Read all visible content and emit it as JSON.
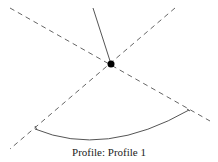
{
  "diagram": {
    "caption": "Profile:  Profile 1",
    "colors": {
      "line": "#555555",
      "dashed": "#666666",
      "point": "#000000",
      "background": "#ffffff"
    },
    "elements": {
      "solid_line": {
        "x1": 93,
        "y1": 8,
        "x2": 111,
        "y2": 64
      },
      "dashed_line_a": {
        "x1": 10,
        "y1": 8,
        "x2": 210,
        "y2": 121
      },
      "dashed_line_b": {
        "x1": 175,
        "y1": 8,
        "x2": 10,
        "y2": 149
      },
      "center_point": {
        "cx": 111,
        "cy": 64,
        "r": 3.5
      },
      "arc": {
        "start": [
          35,
          129
        ],
        "end": [
          189,
          110
        ],
        "control": [
          105,
          158
        ]
      }
    }
  }
}
